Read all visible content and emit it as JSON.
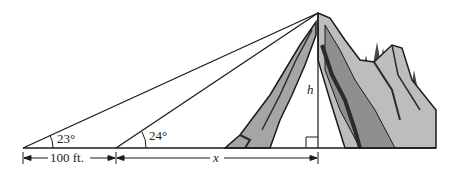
{
  "diagram": {
    "type": "trigonometry-elevation",
    "labels": {
      "angle_far": "23°",
      "angle_near": "24°",
      "distance_between": "100 ft.",
      "distance_unknown": "x",
      "height": "h"
    },
    "colors": {
      "line": "#1a1a1a",
      "rock_light": "#bdbdbd",
      "rock_mid": "#8f8f8f",
      "rock_dark": "#2b2b2b",
      "tree": "#4a4a4a"
    }
  }
}
